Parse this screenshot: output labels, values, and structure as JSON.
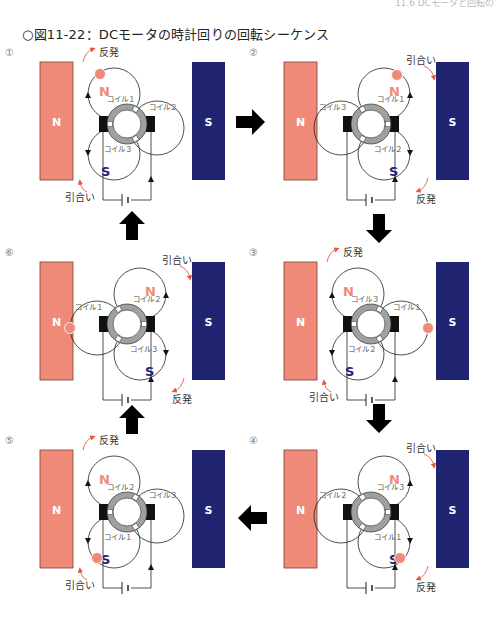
{
  "header": {
    "running_head": "11.6 DCモータと回転の"
  },
  "figure": {
    "title": "○図11-22：DCモータの時計回りの回転シーケンス",
    "colors": {
      "north": "#f08a78",
      "south": "#1f2370",
      "attract_arrow": "#e8573e",
      "commutator": "#a0a0a0",
      "brush": "#111111",
      "arrow": "#000000"
    },
    "labels": {
      "repel": "反発",
      "attract": "引合い",
      "N": "N",
      "S": "S"
    },
    "panels": [
      {
        "step": "①",
        "coil_top": "コイル１",
        "coil_side": "コイル２",
        "coil_bottom": "コイル３"
      },
      {
        "step": "②",
        "coil_top": "コイル１",
        "coil_side": "コイル３",
        "coil_bottom": "コイル２"
      },
      {
        "step": "③",
        "coil_top": "コイル３",
        "coil_side": "コイル１",
        "coil_bottom": "コイル２"
      },
      {
        "step": "④",
        "coil_top": "コイル３",
        "coil_side": "コイル２",
        "coil_bottom": "コイル１"
      },
      {
        "step": "⑤",
        "coil_top": "コイル２",
        "coil_side": "コイル３",
        "coil_bottom": "コイル１"
      },
      {
        "step": "⑥",
        "coil_top": "コイル２",
        "coil_side": "コイル１",
        "coil_bottom": "コイル３"
      }
    ],
    "sequence_arrows": [
      "right",
      "down",
      "down",
      "left",
      "up",
      "up"
    ]
  }
}
